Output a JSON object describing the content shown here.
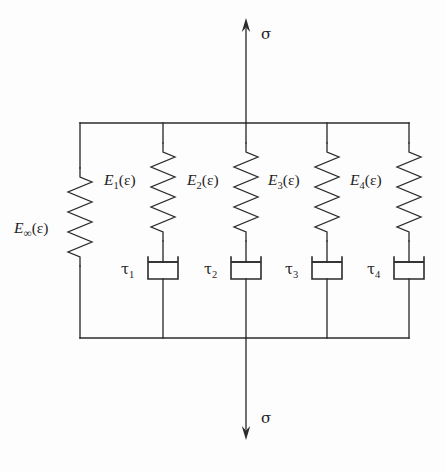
{
  "figure": {
    "kind": "mechanical-rheological-network-diagram",
    "background_color": "#fdfdfd",
    "line_color": "#2b2b2b",
    "text_color": "#1f1f1f",
    "width": 445,
    "height": 472
  },
  "chart_data": {
    "type": "diagram",
    "title": "",
    "xlabel": "",
    "ylabel": "",
    "frame": {
      "left_x": 80,
      "right_x": 409,
      "top_y": 123,
      "bottom_y": 338
    },
    "load": {
      "symbol": "σ",
      "top_arrow": {
        "x": 246,
        "tail_y": 123,
        "tip_y": 18,
        "direction": "up",
        "label_x": 261,
        "label_y": 39
      },
      "bottom_arrow": {
        "x": 246,
        "tail_y": 338,
        "tip_y": 440,
        "direction": "down",
        "label_x": 261,
        "label_y": 423
      }
    },
    "branches": [
      {
        "id": "branch-infinity",
        "x": 80,
        "modulus_label": {
          "base": "E",
          "subscript": "∞",
          "argument": "(ε)",
          "text": "E∞(ε)"
        },
        "modulus_label_x": 14,
        "modulus_label_y": 233,
        "spring": {
          "top_y": 168,
          "bottom_y": 266,
          "coils": 4,
          "amplitude": 12
        },
        "dashpot": null,
        "dashpot_label": null
      },
      {
        "id": "branch-1",
        "x": 163,
        "modulus_label": {
          "base": "E",
          "subscript": "1",
          "argument": "(ε)",
          "text": "E1(ε)"
        },
        "modulus_label_x": 104,
        "modulus_label_y": 185,
        "spring": {
          "top_y": 143,
          "bottom_y": 241,
          "coils": 4,
          "amplitude": 12
        },
        "dashpot": {
          "piston_y": 262,
          "cyl_bottom_y": 279,
          "half_width": 15
        },
        "dashpot_label": {
          "base": "τ",
          "subscript": "1",
          "text": "τ1"
        },
        "dashpot_label_x": 121,
        "dashpot_label_y": 274
      },
      {
        "id": "branch-2",
        "x": 246,
        "modulus_label": {
          "base": "E",
          "subscript": "2",
          "argument": "(ε)",
          "text": "E2(ε)"
        },
        "modulus_label_x": 187,
        "modulus_label_y": 185,
        "spring": {
          "top_y": 143,
          "bottom_y": 241,
          "coils": 4,
          "amplitude": 12
        },
        "dashpot": {
          "piston_y": 262,
          "cyl_bottom_y": 279,
          "half_width": 15
        },
        "dashpot_label": {
          "base": "τ",
          "subscript": "2",
          "text": "τ2"
        },
        "dashpot_label_x": 204,
        "dashpot_label_y": 274
      },
      {
        "id": "branch-3",
        "x": 327,
        "modulus_label": {
          "base": "E",
          "subscript": "3",
          "argument": "(ε)",
          "text": "E3(ε)"
        },
        "modulus_label_x": 268,
        "modulus_label_y": 185,
        "spring": {
          "top_y": 143,
          "bottom_y": 241,
          "coils": 4,
          "amplitude": 12
        },
        "dashpot": {
          "piston_y": 262,
          "cyl_bottom_y": 279,
          "half_width": 15
        },
        "dashpot_label": {
          "base": "τ",
          "subscript": "3",
          "text": "τ3"
        },
        "dashpot_label_x": 285,
        "dashpot_label_y": 274
      },
      {
        "id": "branch-4",
        "x": 409,
        "modulus_label": {
          "base": "E",
          "subscript": "4",
          "argument": "(ε)",
          "text": "E4(ε)"
        },
        "modulus_label_x": 350,
        "modulus_label_y": 185,
        "spring": {
          "top_y": 143,
          "bottom_y": 241,
          "coils": 4,
          "amplitude": 12
        },
        "dashpot": {
          "piston_y": 262,
          "cyl_bottom_y": 279,
          "half_width": 15
        },
        "dashpot_label": {
          "base": "τ",
          "subscript": "4",
          "text": "τ4"
        },
        "dashpot_label_x": 367,
        "dashpot_label_y": 274
      }
    ]
  },
  "labels": {
    "sigma_top": "σ",
    "sigma_bottom": "σ",
    "modulus_base": "E",
    "strain_argument": "(ε)",
    "subscripts": [
      "∞",
      "1",
      "2",
      "3",
      "4"
    ],
    "tau_base": "τ"
  }
}
